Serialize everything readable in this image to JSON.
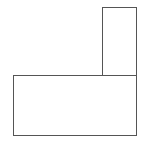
{
  "diagram": {
    "background": "#ffffff",
    "stroke_color": "#555555",
    "stroke_width": 1,
    "shapes": [
      {
        "id": "tall-rectangle",
        "type": "rectangle",
        "x": 102,
        "y": 7,
        "width": 35,
        "height": 69
      },
      {
        "id": "wide-rectangle",
        "type": "rectangle",
        "x": 13,
        "y": 75,
        "width": 124,
        "height": 61
      }
    ]
  }
}
